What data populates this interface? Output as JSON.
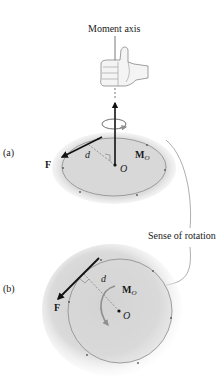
{
  "figure": {
    "top_label": "Moment axis",
    "side_label": "Sense of rotation",
    "panels": [
      {
        "id": "a",
        "label": "(a)",
        "force_label": "F",
        "distance_label": "d",
        "moment_label": "M",
        "moment_subscript": "O",
        "point_label": "O"
      },
      {
        "id": "b",
        "label": "(b)",
        "force_label": "F",
        "distance_label": "d",
        "moment_label": "M",
        "moment_subscript": "O",
        "point_label": "O"
      }
    ],
    "colors": {
      "line": "#1a1a1a",
      "circle": "#8a8a8a",
      "shade": "#d6d6d6",
      "arrow_gray": "#8f8f8f"
    },
    "icons": [
      "thumbs-up-hand-icon",
      "rotation-arrow-icon",
      "force-arrow-icon"
    ]
  }
}
